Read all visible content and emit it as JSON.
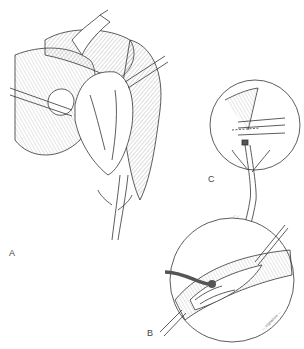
{
  "figure": {
    "type": "surgical illustration",
    "panels": [
      {
        "id": "A",
        "label": "A",
        "description": "Main operative view with retractors and forceps exposing organ and ductal branching"
      },
      {
        "id": "B",
        "label": "B",
        "description": "Circular inset: incised duct with catheter/tube inserted, stay sutures"
      },
      {
        "id": "C",
        "label": "C",
        "description": "Circular inset: ligated duct with clamps at proximal end"
      }
    ],
    "signature": "— signature —",
    "colors": {
      "ink": "#333333",
      "background": "#ffffff",
      "tube": "#555555"
    }
  }
}
